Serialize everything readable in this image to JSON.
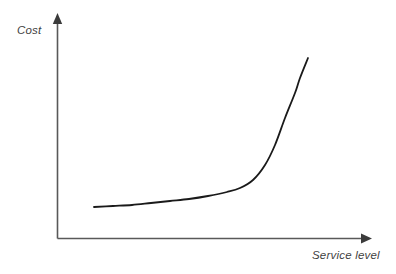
{
  "figure": {
    "width": 396,
    "height": 274,
    "background_color": "#ffffff",
    "axis_color": "#595959",
    "curve_color": "#1a1a1a"
  },
  "labels": {
    "y_axis": "Cost",
    "x_axis": "Service level"
  },
  "chart_data": {
    "type": "line",
    "title": "",
    "subtitle": "",
    "xlabel": "Service level",
    "ylabel": "Cost",
    "grid": false,
    "legend": null,
    "axis_style": "arrow-headed open axes, no tick marks, no tick labels",
    "xlim": [
      0,
      1
    ],
    "ylim": [
      0,
      1
    ],
    "annotations": [],
    "series": [
      {
        "name": "Cost curve",
        "color": "#1a1a1a",
        "x": [
          0.12,
          0.18,
          0.24,
          0.3,
          0.36,
          0.42,
          0.48,
          0.54,
          0.6,
          0.66,
          0.72,
          0.78,
          0.84,
          0.9,
          0.96,
          1.0
        ],
        "y": [
          0.14,
          0.146,
          0.153,
          0.162,
          0.173,
          0.186,
          0.203,
          0.225,
          0.255,
          0.296,
          0.352,
          0.432,
          0.545,
          0.7,
          0.86,
          0.96
        ],
        "points_px": [
          [
            94,
            207
          ],
          [
            113,
            206
          ],
          [
            132,
            205
          ],
          [
            151,
            203
          ],
          [
            170,
            201
          ],
          [
            189,
            199
          ],
          [
            208,
            196
          ],
          [
            227,
            192
          ],
          [
            240,
            188
          ],
          [
            253,
            180
          ],
          [
            265,
            165
          ],
          [
            275,
            145
          ],
          [
            285,
            118
          ],
          [
            295,
            93
          ],
          [
            300,
            78
          ],
          [
            308,
            58
          ]
        ]
      }
    ]
  }
}
